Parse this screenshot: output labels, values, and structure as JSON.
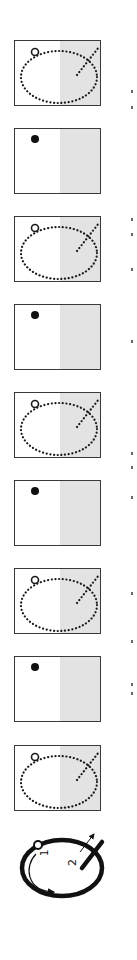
{
  "figure": {
    "orientation": "rotated-90",
    "colors": {
      "border": "#3a3a3a",
      "shade": "#e3e3e3",
      "dots": "#1a1a1a",
      "background": "#ffffff"
    },
    "panels": [
      {
        "index": 1,
        "type": "dotted-trajectory",
        "top": 40
      },
      {
        "index": 2,
        "type": "filled-dot",
        "top": 128
      },
      {
        "index": 3,
        "type": "dotted-trajectory",
        "top": 216
      },
      {
        "index": 4,
        "type": "filled-dot",
        "top": 304
      },
      {
        "index": 5,
        "type": "dotted-trajectory",
        "top": 392
      },
      {
        "index": 6,
        "type": "filled-dot",
        "top": 480
      },
      {
        "index": 7,
        "type": "dotted-trajectory",
        "top": 568
      },
      {
        "index": 8,
        "type": "filled-dot",
        "top": 656
      },
      {
        "index": 9,
        "type": "dotted-trajectory",
        "top": 745
      }
    ],
    "summary_icon": {
      "label_1": "1",
      "label_2": "2"
    }
  }
}
